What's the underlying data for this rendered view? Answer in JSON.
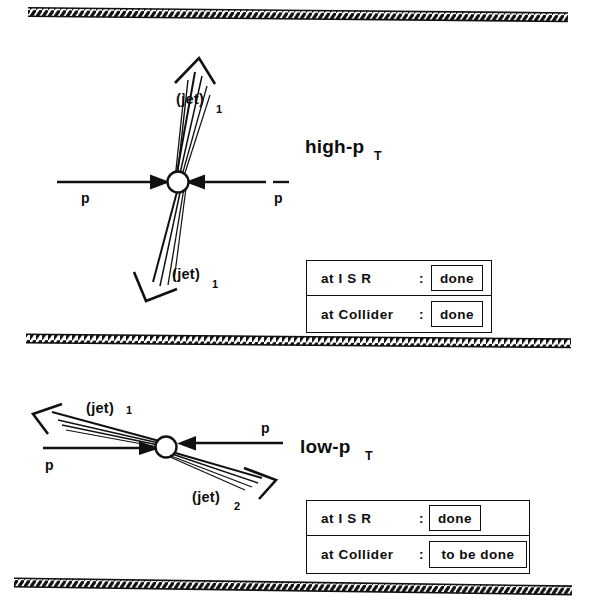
{
  "figure": {
    "title_hidden": "",
    "ink_color": "#111111",
    "background": "#ffffff"
  },
  "panels": [
    {
      "id": "high-pt",
      "regime_label": "high-p",
      "regime_subscript": "T",
      "beams": [
        {
          "id": "beam-left",
          "label": "p"
        },
        {
          "id": "beam-right",
          "label": "p"
        }
      ],
      "jets": [
        {
          "id": "jet-up",
          "label": "(jet)",
          "subscript": "1",
          "direction": "up"
        },
        {
          "id": "jet-down",
          "label": "(jet)",
          "subscript": "1",
          "direction": "down"
        }
      ],
      "status_table": {
        "rows": [
          {
            "label": "at  I S R",
            "colon": ":",
            "value": "done"
          },
          {
            "label": "at  Collider",
            "colon": ":",
            "value": "done"
          }
        ]
      }
    },
    {
      "id": "low-pt",
      "regime_label": "low-p",
      "regime_subscript": "T",
      "beams": [
        {
          "id": "beam-left",
          "label": "p"
        },
        {
          "id": "beam-right",
          "label": "p"
        }
      ],
      "jets": [
        {
          "id": "jet-upleft",
          "label": "(jet)",
          "subscript": "1",
          "direction": "up-left"
        },
        {
          "id": "jet-downright",
          "label": "(jet)",
          "subscript": "2",
          "direction": "down-right"
        }
      ],
      "status_table": {
        "rows": [
          {
            "label": "at  I S R",
            "colon": ":",
            "value": "done"
          },
          {
            "label": "at  Collider",
            "colon": ":",
            "value": "to be done"
          }
        ]
      }
    }
  ],
  "bands": [
    {
      "id": "band-top",
      "kind": "hatched-beam-pipe"
    },
    {
      "id": "band-middle",
      "kind": "hatched-beam-pipe"
    },
    {
      "id": "band-bottom",
      "kind": "hatched-beam-pipe"
    }
  ]
}
